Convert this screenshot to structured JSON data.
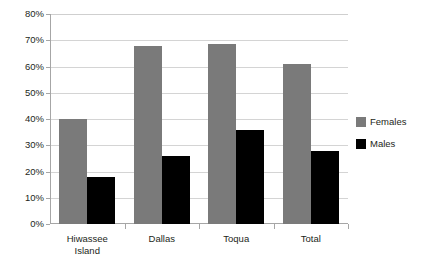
{
  "chart_data": {
    "type": "bar",
    "title": "",
    "subtitle": "",
    "xlabel": "",
    "ylabel": "",
    "categories": [
      "Hiwassee\nIsland",
      "Dallas",
      "Toqua",
      "Total"
    ],
    "series": [
      {
        "name": "Females",
        "color": "#7a7a7a",
        "values": [
          40,
          68,
          68.5,
          61
        ]
      },
      {
        "name": "Males",
        "color": "#000000",
        "values": [
          18,
          26,
          36,
          28
        ]
      }
    ],
    "ylim": [
      0,
      80
    ],
    "ytick_step": 10,
    "ytick_labels": [
      "0%",
      "10%",
      "20%",
      "30%",
      "40%",
      "50%",
      "60%",
      "70%",
      "80%"
    ],
    "ytick_values": [
      0,
      10,
      20,
      30,
      40,
      50,
      60,
      70,
      80
    ],
    "grid": true,
    "grid_axis": "y",
    "legend_position": "right",
    "value_suffix": "%"
  },
  "legend": {
    "items": [
      {
        "label": "Females",
        "color": "#7a7a7a"
      },
      {
        "label": "Males",
        "color": "#000000"
      }
    ]
  },
  "colors": {
    "females": "#7a7a7a",
    "males": "#000000",
    "gridline": "#d4d4d4",
    "axis": "#a6a6a6",
    "text": "#231f20",
    "background": "#ffffff"
  }
}
